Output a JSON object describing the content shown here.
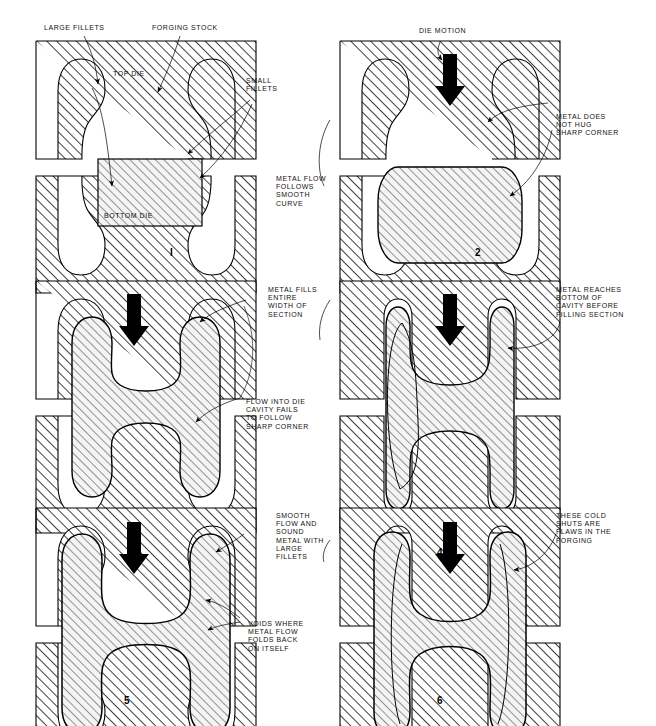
{
  "figure": {
    "type": "technical-illustration",
    "panel_count": 6,
    "columns": 2,
    "rows": 3,
    "ink_color": "#000000",
    "hatch_color": "#000000",
    "background": "#ffffff",
    "stock_fill": "#f2f2f2"
  },
  "panels": [
    {
      "id": "panel-1",
      "number": "I",
      "sequence": 1,
      "column": "left",
      "row": 1,
      "has_die_motion_arrow": false,
      "stage": "open dies with rectangular forging stock in place",
      "labels": [
        {
          "name": "large-fillets",
          "text": "LARGE FILLETS",
          "position": "top-left",
          "leader": true
        },
        {
          "name": "forging-stock",
          "text": "FORGING STOCK",
          "position": "top-center",
          "leader": true
        },
        {
          "name": "top-die",
          "text": "TOP DIE",
          "position": "inside-top",
          "leader": false
        },
        {
          "name": "bottom-die",
          "text": "BOTTOM DIE",
          "position": "inside-bottom",
          "leader": false
        },
        {
          "name": "small-fillets",
          "text": "SMALL\nFILLETS",
          "position": "right",
          "leader": true
        },
        {
          "name": "metal-flow-smooth",
          "text": "METAL FLOW\nFOLLOWS\nSMOOTH\nCURVE",
          "position": "right-lower",
          "leader": true
        }
      ]
    },
    {
      "id": "panel-2",
      "number": "2",
      "sequence": 2,
      "column": "right",
      "row": 1,
      "has_die_motion_arrow": true,
      "stage": "dies closing, stock barrelling and starting to fill cavities",
      "labels": [
        {
          "name": "die-motion",
          "text": "DIE MOTION",
          "position": "top-center",
          "leader": true
        },
        {
          "name": "metal-does-not-hug",
          "text": "METAL DOES\nNOT HUG\nSHARP CORNER",
          "position": "right",
          "leader": true
        }
      ]
    },
    {
      "id": "panel-3",
      "number": "3",
      "sequence": 3,
      "column": "left",
      "row": 2,
      "has_die_motion_arrow": true,
      "stage": "metal spreading laterally, web filled full width",
      "labels": [
        {
          "name": "metal-fills-entire-width",
          "text": "METAL FILLS\nENTIRE\nWIDTH OF\nSECTION",
          "position": "right-upper",
          "leader": true
        },
        {
          "name": "flow-into-die-cavity-fails",
          "text": "FLOW INTO DIE\nCAVITY FAILS\nTO FOLLOW\nSHARP CORNER",
          "position": "right-lower",
          "leader": true
        }
      ]
    },
    {
      "id": "panel-4",
      "number": "4",
      "sequence": 4,
      "column": "right",
      "row": 2,
      "has_die_motion_arrow": true,
      "stage": "metal reaches rib bottoms while the web is still unfilled",
      "labels": [
        {
          "name": "metal-reaches-bottom",
          "text": "METAL REACHES\nBOTTOM OF\nCAVITY BEFORE\nFILLING SECTION",
          "position": "right",
          "leader": true
        }
      ]
    },
    {
      "id": "panel-5",
      "number": "5",
      "sequence": 5,
      "column": "left",
      "row": 3,
      "has_die_motion_arrow": true,
      "stage": "completed forging with large fillets, sound metal",
      "labels": [
        {
          "name": "smooth-flow-sound-metal",
          "text": "SMOOTH\nFLOW AND\nSOUND\nMETAL WITH\nLARGE\nFILLETS",
          "position": "right-upper",
          "leader": true
        },
        {
          "name": "voids-where-metal-folds",
          "text": "VOIDS WHERE\nMETAL FLOW\nFOLDS BACK\nON ITSELF",
          "position": "right-lower",
          "leader": true
        }
      ]
    },
    {
      "id": "panel-6",
      "number": "6",
      "sequence": 6,
      "column": "right",
      "row": 3,
      "has_die_motion_arrow": true,
      "stage": "completed forging with small fillets, cold shuts present",
      "labels": [
        {
          "name": "cold-shuts-are-flaws",
          "text": "THESE COLD\nSHUTS ARE\nFLAWS IN THE\nFORGING",
          "position": "right-upper",
          "leader": true
        }
      ]
    }
  ],
  "icons": {
    "die_motion_arrow": "down-arrow-icon",
    "leader_line": "leader-line-icon",
    "hatch": "section-hatch-icon"
  }
}
